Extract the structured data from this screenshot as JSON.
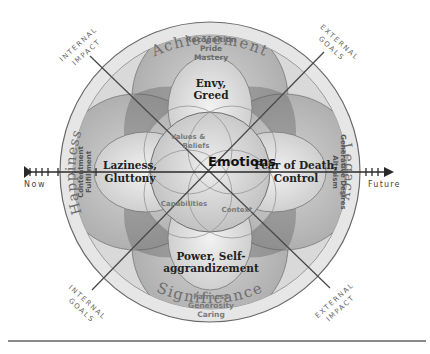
{
  "diagram": {
    "outer_ring_labels": {
      "top": "Achievement",
      "bottom": "Significance",
      "left": "Happiness",
      "right": "Legacy"
    },
    "outer_petal_texts": {
      "top": [
        "Recognition",
        "Pride",
        "Mastery"
      ],
      "bottom": [
        "Fairness",
        "Generosity",
        "Caring"
      ],
      "left": [
        "Contentment",
        "Fulfillment"
      ],
      "right": [
        "Altruism",
        "Generative Desires"
      ]
    },
    "inner_petal_texts": {
      "top": [
        "Envy,",
        "Greed"
      ],
      "bottom": [
        "Power, Self-",
        "aggrandizement"
      ],
      "left": [
        "Laziness,",
        "Gluttony"
      ],
      "right": [
        "Fear of Death,",
        "Control"
      ]
    },
    "center": {
      "title": "Emotions",
      "values": [
        "Values &",
        "Beliefs"
      ],
      "capabilities": "Capabilities",
      "context": "Context"
    },
    "axis": {
      "start_label": "Now",
      "end_label": "Future"
    },
    "diagonal_labels": {
      "top_left": [
        "INTERNAL",
        "IMPACT"
      ],
      "top_right": [
        "EXTERNAL",
        "GOALS"
      ],
      "bottom_left": [
        "INTERNAL",
        "GOALS"
      ],
      "bottom_right": [
        "EXTERNAL",
        "IMPACT"
      ]
    },
    "colors": {
      "outer_ring": "#e4e4e4",
      "outer_petal": "#b9b9b9",
      "petal_overlap": "#8f8f8f",
      "inner_petal": "#d8d8d8",
      "center": "#cfcfcf",
      "line": "#4a4a4a",
      "label_gray": "#7a7a7a",
      "bottom_rule": "#8a8a8a"
    }
  }
}
